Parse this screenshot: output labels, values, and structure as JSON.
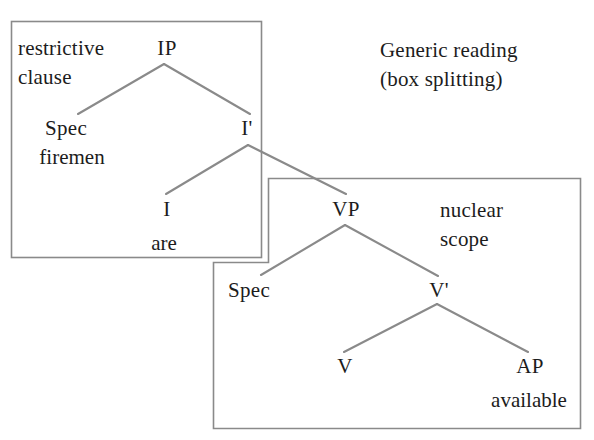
{
  "figure": {
    "title_annotation": {
      "line1": "Generic reading",
      "line2": "(box splitting)"
    },
    "boxes": [
      {
        "id": "restrictive-clause-box",
        "label_line1": "restrictive",
        "label_line2": "clause",
        "shape": "rectangle",
        "x": 11,
        "y": 21,
        "width": 251,
        "height": 237,
        "stroke": "#8a8a8a"
      },
      {
        "id": "nuclear-scope-box",
        "label_line1": "nuclear",
        "label_line2": "scope",
        "shape": "notched-rectangle",
        "x": 213,
        "y": 178,
        "width": 368,
        "height": 251,
        "stroke": "#8a8a8a"
      }
    ],
    "tree": {
      "nodes": [
        {
          "id": "IP",
          "label": "IP",
          "x": 167,
          "y": 48
        },
        {
          "id": "SpecIP",
          "label": "Spec",
          "x": 66,
          "y": 128
        },
        {
          "id": "Ibar",
          "label": "I'",
          "x": 247,
          "y": 128
        },
        {
          "id": "I",
          "label": "I",
          "x": 167,
          "y": 209
        },
        {
          "id": "VP",
          "label": "VP",
          "x": 346,
          "y": 209
        },
        {
          "id": "SpecVP",
          "label": "Spec",
          "x": 249,
          "y": 290
        },
        {
          "id": "Vbar",
          "label": "V'",
          "x": 439,
          "y": 290
        },
        {
          "id": "V",
          "label": "V",
          "x": 345,
          "y": 366
        },
        {
          "id": "AP",
          "label": "AP",
          "x": 530,
          "y": 366
        }
      ],
      "terminals": [
        {
          "id": "firemen",
          "label": "firemen",
          "x": 72,
          "y": 157
        },
        {
          "id": "are",
          "label": "are",
          "x": 164,
          "y": 243
        },
        {
          "id": "available",
          "label": "available",
          "x": 529,
          "y": 400
        }
      ],
      "edges": [
        {
          "id": "IP-Spec",
          "from": "IP",
          "to": "SpecIP",
          "x1": 164,
          "y1": 64,
          "x2": 78,
          "y2": 114
        },
        {
          "id": "IP-Ibar",
          "from": "IP",
          "to": "Ibar",
          "x1": 164,
          "y1": 64,
          "x2": 250,
          "y2": 114
        },
        {
          "id": "Ibar-I",
          "from": "Ibar",
          "to": "I",
          "x1": 248,
          "y1": 145,
          "x2": 166,
          "y2": 194
        },
        {
          "id": "Ibar-VP",
          "from": "Ibar",
          "to": "VP",
          "x1": 248,
          "y1": 145,
          "x2": 346,
          "y2": 194
        },
        {
          "id": "VP-Spec",
          "from": "VP",
          "to": "SpecVP",
          "x1": 345,
          "y1": 225,
          "x2": 261,
          "y2": 275
        },
        {
          "id": "VP-Vbar",
          "from": "VP",
          "to": "Vbar",
          "x1": 345,
          "y1": 225,
          "x2": 438,
          "y2": 276
        },
        {
          "id": "Vbar-V",
          "from": "Vbar",
          "to": "V",
          "x1": 437,
          "y1": 304,
          "x2": 344,
          "y2": 352
        },
        {
          "id": "Vbar-AP",
          "from": "Vbar",
          "to": "AP",
          "x1": 437,
          "y1": 304,
          "x2": 528,
          "y2": 352
        }
      ]
    },
    "colors": {
      "line": "#8a8a8a",
      "text": "#1c1c1c",
      "background": "#ffffff"
    }
  }
}
